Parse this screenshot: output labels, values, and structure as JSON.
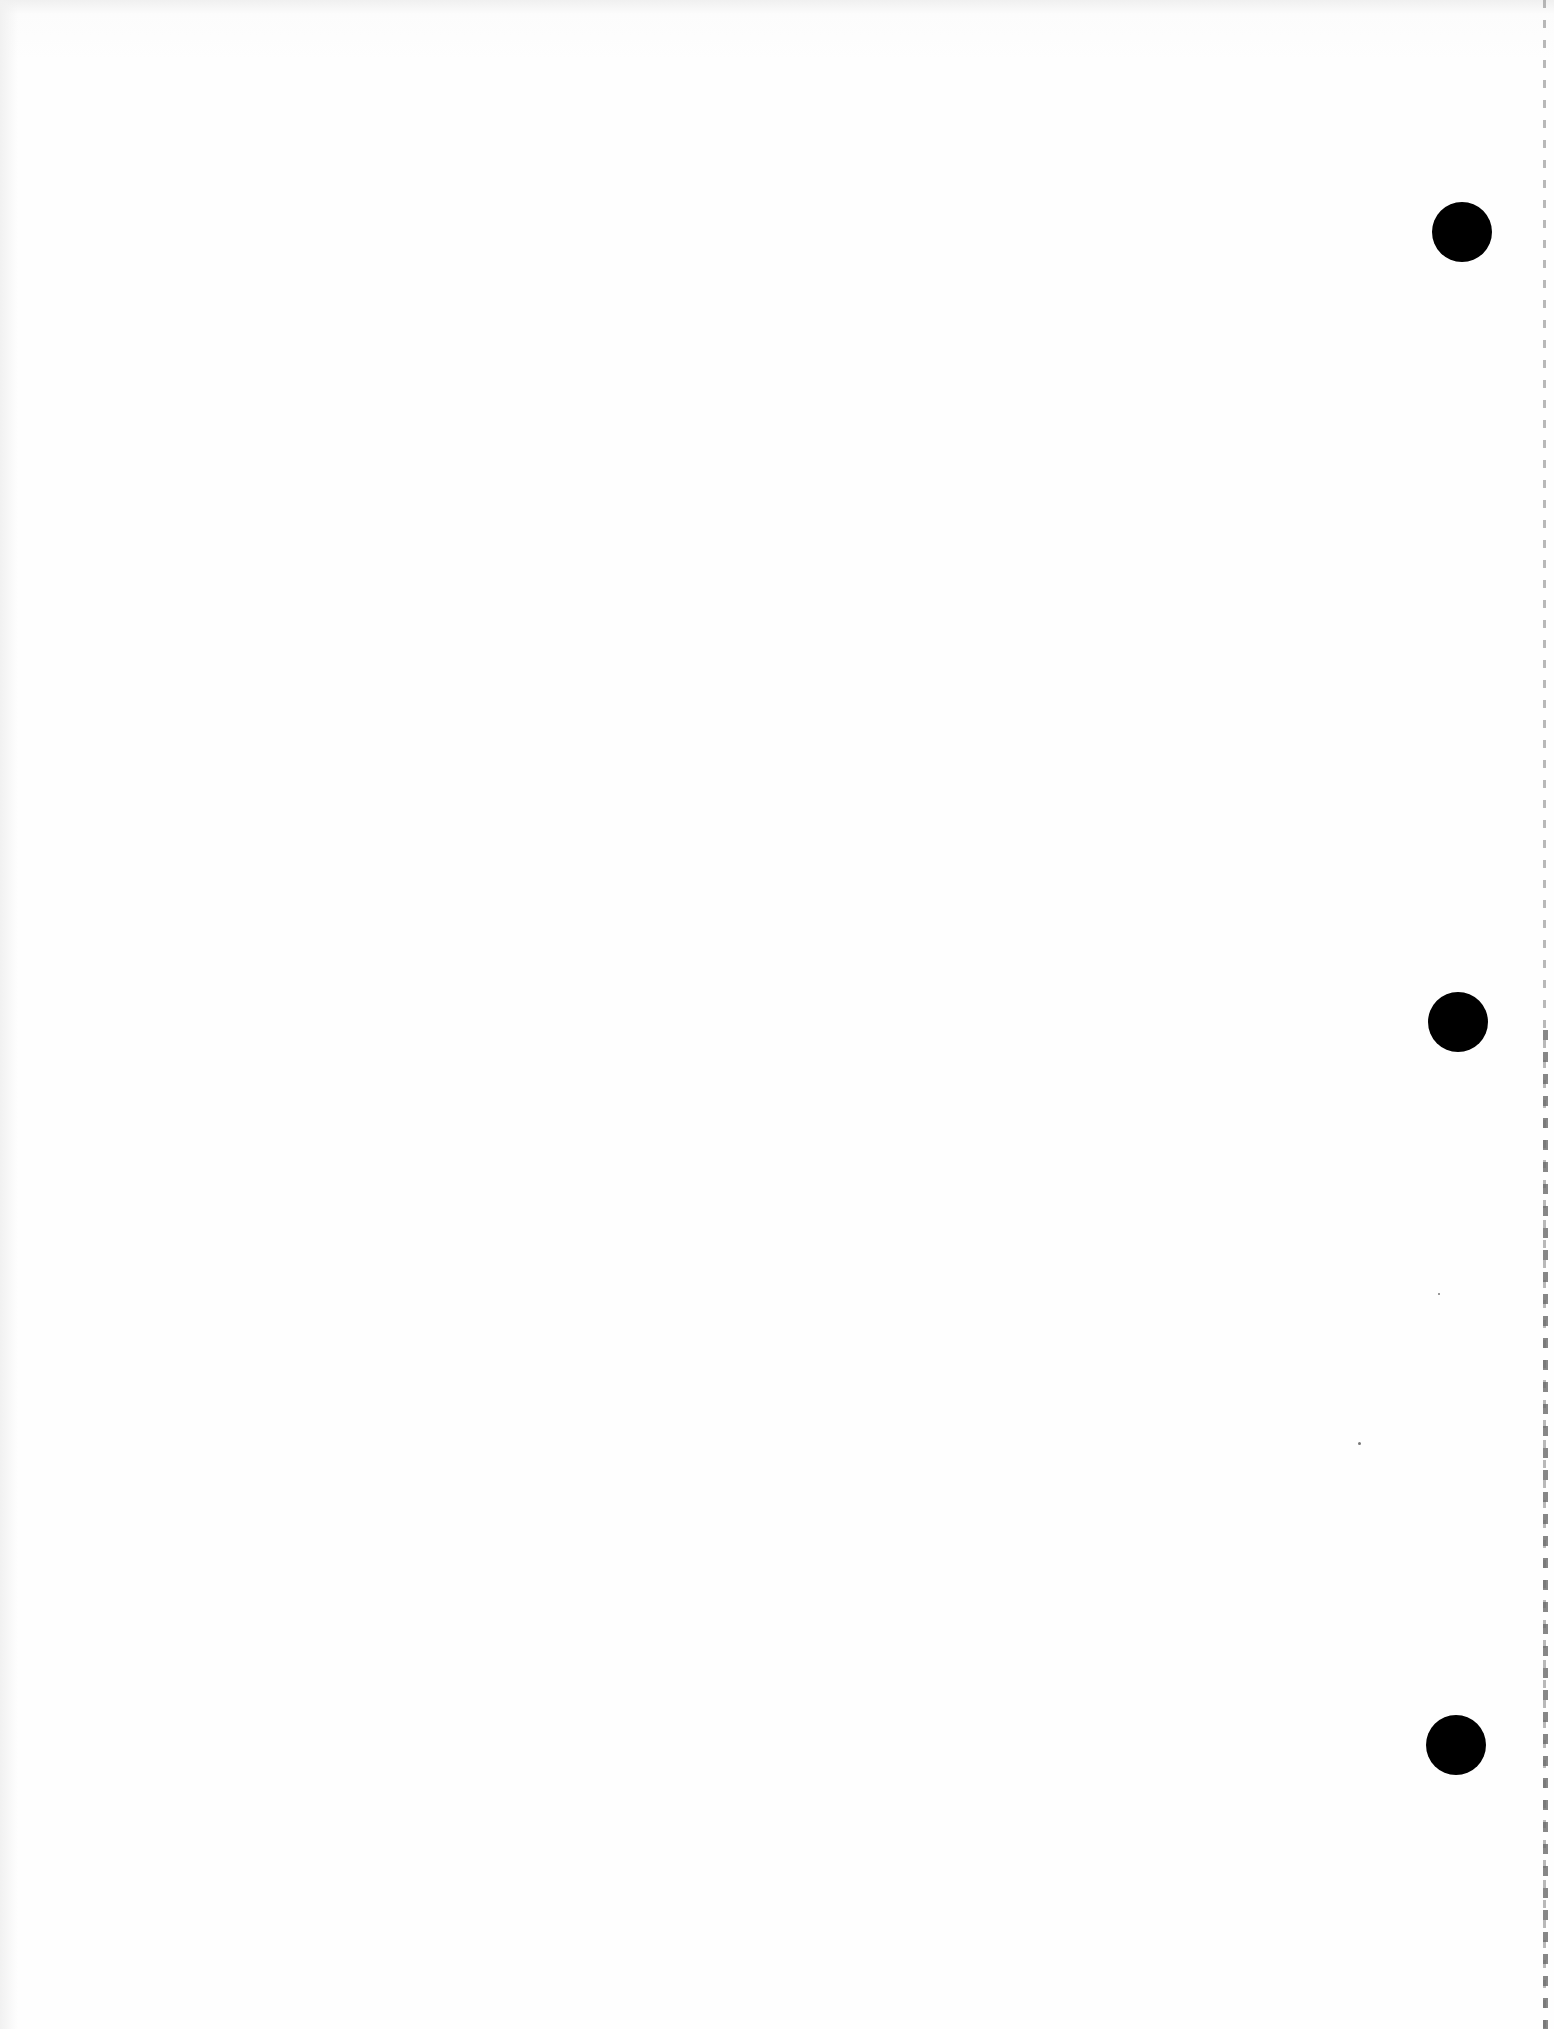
{
  "document": {
    "type": "blank scanned page",
    "punch_holes": [
      {
        "name": "top",
        "cx": 1462,
        "cy": 232,
        "r": 30
      },
      {
        "name": "middle",
        "cx": 1458,
        "cy": 1022,
        "r": 30
      },
      {
        "name": "bottom",
        "cx": 1456,
        "cy": 1745,
        "r": 30
      }
    ],
    "colors": {
      "paper": "#fdfdfd",
      "holes": "#000000",
      "perforation": "#9a9a9a"
    }
  }
}
